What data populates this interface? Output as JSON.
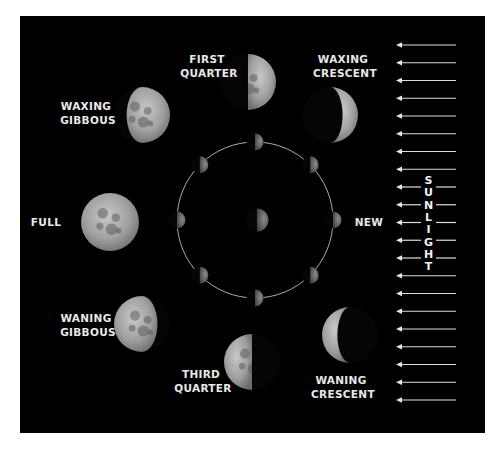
{
  "colors": {
    "background": "#000000",
    "page": "#ffffff",
    "label": "#e8e8e8",
    "moon_light": "#b9b9b9",
    "moon_dark": "#555555",
    "orbit": "#cfcfcf",
    "arrow": "#dddddd"
  },
  "phases": [
    {
      "id": "first-quarter",
      "label_lines": [
        "FIRST",
        "QUARTER"
      ],
      "lit": "right-half"
    },
    {
      "id": "waxing-crescent",
      "label_lines": [
        "WAXING",
        "CRESCENT"
      ],
      "lit": "right-crescent"
    },
    {
      "id": "waxing-gibbous",
      "label_lines": [
        "WAXING",
        "GIBBOUS"
      ],
      "lit": "right-gibbous"
    },
    {
      "id": "full",
      "label_lines": [
        "FULL"
      ],
      "lit": "full"
    },
    {
      "id": "new",
      "label_lines": [
        "NEW"
      ],
      "lit": "none"
    },
    {
      "id": "waning-gibbous",
      "label_lines": [
        "WANING",
        "GIBBOUS"
      ],
      "lit": "left-gibbous"
    },
    {
      "id": "third-quarter",
      "label_lines": [
        "THIRD",
        "QUARTER"
      ],
      "lit": "left-half"
    },
    {
      "id": "waning-crescent",
      "label_lines": [
        "WANING",
        "CRESCENT"
      ],
      "lit": "left-crescent"
    }
  ],
  "orbit": {
    "moon_count": 8,
    "center_body": "earth",
    "lit_side": "right"
  },
  "sunlight": {
    "label": "SUNLIGHT",
    "letters": [
      "S",
      "U",
      "N",
      "L",
      "I",
      "G",
      "H",
      "T"
    ],
    "arrow_count": 21,
    "direction": "left"
  }
}
